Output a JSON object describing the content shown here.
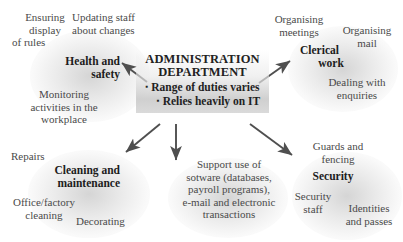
{
  "diagram": {
    "type": "spider-diagram",
    "center": {
      "title_line1": "ADMINISTRATION",
      "title_line2": "DEPARTMENT",
      "bullets": [
        "Range of duties varies",
        "Relies heavily on IT"
      ],
      "bullet_glyph": "▪"
    },
    "branches": [
      {
        "id": "health-and-safety",
        "label_line1": "Health and",
        "label_line2": "safety",
        "leaves": [
          "Ensuring display of rules",
          "Updating staff about changes",
          "Monitoring activities in the workplace"
        ]
      },
      {
        "id": "clerical-work",
        "label_line1": "Clerical",
        "label_line2": "work",
        "leaves": [
          "Organising meetings",
          "Organising mail",
          "Dealing with enquiries"
        ]
      },
      {
        "id": "cleaning-and-maintenance",
        "label_line1": "Cleaning and",
        "label_line2": "maintenance",
        "leaves": [
          "Repairs",
          "Office/factory cleaning",
          "Decorating"
        ]
      },
      {
        "id": "it-support",
        "label_line1": "",
        "label_line2": "",
        "leaves": [
          "Support use of sotware (databases, payroll programs), e-mail and electronic transactions"
        ]
      },
      {
        "id": "security",
        "label_line1": "Security",
        "label_line2": "",
        "leaves": [
          "Guards and fencing",
          "Security staff",
          "Identities and passes"
        ]
      }
    ]
  },
  "text": {
    "ensuring_display_of_rules_l1": "Ensuring",
    "ensuring_display_of_rules_l2": "display",
    "ensuring_display_of_rules_l3": "of rules",
    "updating_staff_l1": "Updating staff",
    "updating_staff_l2": "about changes",
    "health_and_safety_l1": "Health and",
    "health_and_safety_l2": "safety",
    "monitoring_l1": "Monitoring",
    "monitoring_l2": "activities in the",
    "monitoring_l3": "workplace",
    "organising_meetings_l1": "Organising",
    "organising_meetings_l2": "meetings",
    "organising_mail_l1": "Organising",
    "organising_mail_l2": "mail",
    "clerical_work_l1": "Clerical",
    "clerical_work_l2": "work",
    "dealing_with_enquiries_l1": "Dealing with",
    "dealing_with_enquiries_l2": "enquiries",
    "repairs": "Repairs",
    "cleaning_and_maintenance_l1": "Cleaning and",
    "cleaning_and_maintenance_l2": "maintenance",
    "office_factory_cleaning_l1": "Office/factory",
    "office_factory_cleaning_l2": "cleaning",
    "decorating": "Decorating",
    "it_support_l1": "Support use of",
    "it_support_l2": "sotware (databases,",
    "it_support_l3": "payroll programs),",
    "it_support_l4": "e-mail and electronic",
    "it_support_l5": "transactions",
    "guards_and_fencing_l1": "Guards and",
    "guards_and_fencing_l2": "fencing",
    "security": "Security",
    "security_staff_l1": "Security",
    "security_staff_l2": "staff",
    "identities_and_passes_l1": "Identities",
    "identities_and_passes_l2": "and passes",
    "center_title_l1": "ADMINISTRATION",
    "center_title_l2": "DEPARTMENT",
    "center_bullet_1": "Range of duties varies",
    "center_bullet_2": "Relies heavily on IT",
    "bullet_glyph": "▪"
  },
  "colors": {
    "background": "#ffffff",
    "text": "#4a4a4a",
    "heading": "#1c1c1c",
    "arrow": "#4f4f4f",
    "center_box": "#cdcdcd"
  }
}
